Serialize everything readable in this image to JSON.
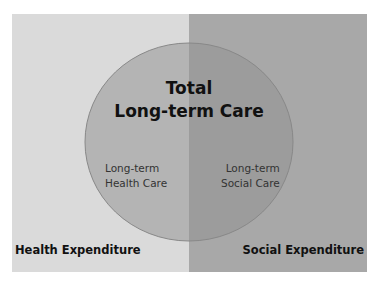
{
  "diagram": {
    "title_line1": "Total",
    "title_line2": "Long-term Care",
    "left_region": {
      "label": "Health Expenditure",
      "inner_line1": "Long-term",
      "inner_line2": "Health Care",
      "color": "#dadada"
    },
    "right_region": {
      "label": "Social Expenditure",
      "inner_line1": "Long-term",
      "inner_line2": "Social Care",
      "color": "#a8a8a8"
    },
    "circle": {
      "fill_left": "#b4b4b4",
      "fill_right": "#9c9c9c",
      "stroke": "#888888"
    }
  }
}
